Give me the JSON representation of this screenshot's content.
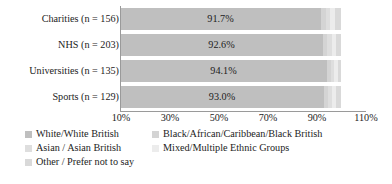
{
  "chart_data": {
    "type": "bar",
    "orientation": "horizontal",
    "stacked": true,
    "title": "",
    "xlabel": "",
    "ylabel": "",
    "xlim": [
      10,
      110
    ],
    "grid": false,
    "legend_position": "bottom",
    "categories": [
      "Charities (n = 156)",
      "NHS (n = 203)",
      "Universities (n = 135)",
      "Sports (n = 129)"
    ],
    "xticks": [
      "10%",
      "30%",
      "50%",
      "70%",
      "90%",
      "110%"
    ],
    "xtick_values": [
      10,
      30,
      50,
      70,
      90,
      110
    ],
    "data_labels": [
      "91.7%",
      "92.6%",
      "94.1%",
      "93.0%"
    ],
    "series": [
      {
        "name": "White/White British",
        "color": "#bfbfbf",
        "values": [
          91.7,
          92.6,
          94.1,
          93.0
        ]
      },
      {
        "name": "Black/African/Caribbean/Black British",
        "color": "#d4d4d4",
        "values": [
          1.9,
          1.5,
          1.5,
          1.6
        ]
      },
      {
        "name": "Asian / Asian British",
        "color": "#dedede",
        "values": [
          1.9,
          2.0,
          1.5,
          1.6
        ]
      },
      {
        "name": "Mixed/Multiple Ethnic Groups",
        "color": "#ececec",
        "values": [
          1.9,
          1.5,
          1.5,
          1.6
        ]
      },
      {
        "name": "Other / Prefer not to say",
        "color": "#d9d9d9",
        "values": [
          2.6,
          2.4,
          1.4,
          2.2
        ]
      }
    ]
  },
  "legend": {
    "items": [
      {
        "label": "White/White British",
        "color": "#bfbfbf"
      },
      {
        "label": "Black/African/Caribbean/Black British",
        "color": "#d4d4d4"
      },
      {
        "label": "Asian / Asian British",
        "color": "#dedede"
      },
      {
        "label": "Mixed/Multiple Ethnic Groups",
        "color": "#ececec"
      },
      {
        "label": "Other / Prefer not to say",
        "color": "#d9d9d9"
      }
    ]
  }
}
